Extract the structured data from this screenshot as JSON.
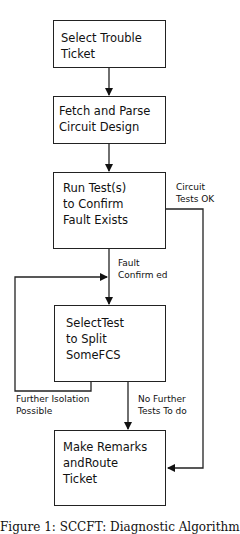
{
  "diagram": {
    "type": "flowchart",
    "nodes": [
      {
        "id": "select_ticket",
        "lines": [
          "Select Trouble",
          "Ticket"
        ]
      },
      {
        "id": "fetch_parse",
        "lines": [
          "Fetch and Parse",
          "Circuit  Design"
        ]
      },
      {
        "id": "run_tests",
        "lines": [
          "Run Test(s)",
          "to Confirm",
          "Fault  Exists"
        ]
      },
      {
        "id": "select_test",
        "lines": [
          "SelectTest",
          "to Split",
          "SomeFCS"
        ]
      },
      {
        "id": "make_remarks",
        "lines": [
          "Make Remarks",
          "andRoute",
          "Ticket"
        ]
      }
    ],
    "edge_labels": {
      "circuit_ok": [
        "Circuit",
        "Tests OK"
      ],
      "fault_confirmed": [
        "Fault",
        "Confirm ed"
      ],
      "further_isolation": [
        "Further Isolation",
        "Possible"
      ],
      "no_further": [
        "No Further",
        "Tests To do"
      ]
    },
    "edges": [
      {
        "from": "select_ticket",
        "to": "fetch_parse"
      },
      {
        "from": "fetch_parse",
        "to": "run_tests"
      },
      {
        "from": "run_tests",
        "to": "select_test",
        "label": "Fault Confirmed"
      },
      {
        "from": "run_tests",
        "to": "make_remarks",
        "label": "Circuit Tests OK"
      },
      {
        "from": "select_test",
        "to": "select_test",
        "label": "Further Isolation Possible"
      },
      {
        "from": "select_test",
        "to": "make_remarks",
        "label": "No Further Tests To do"
      }
    ],
    "caption": "Figure 1: SCCFT: Diagnostic Algorithm"
  }
}
